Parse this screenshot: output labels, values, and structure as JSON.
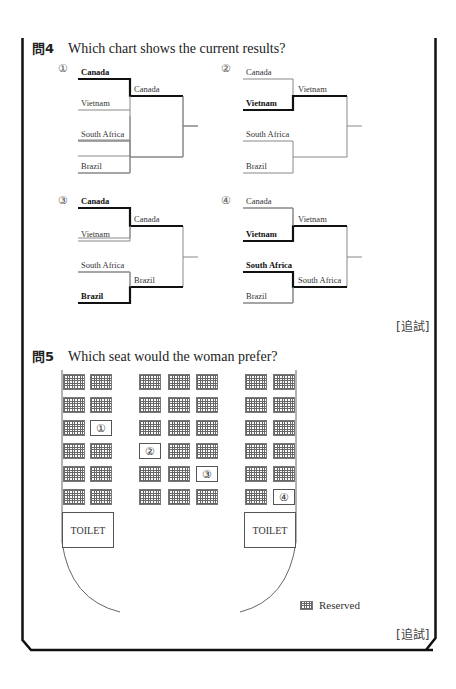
{
  "question4": {
    "number": "問4",
    "prompt": "Which chart shows the current results?",
    "options": [
      {
        "label": "①",
        "teams": [
          "Canada",
          "Vietnam",
          "South Africa",
          "Brazil"
        ],
        "winners_round1": [
          "Canada",
          ""
        ],
        "bold": [
          "Canada"
        ]
      },
      {
        "label": "②",
        "teams": [
          "Canada",
          "Vietnam",
          "South Africa",
          "Brazil"
        ],
        "winners_round1": [
          "Vietnam",
          ""
        ],
        "bold": [
          "Vietnam"
        ]
      },
      {
        "label": "③",
        "teams": [
          "Canada",
          "Vietnam",
          "South Africa",
          "Brazil"
        ],
        "winners_round1": [
          "Canada",
          "Brazil"
        ],
        "bold": [
          "Canada",
          "Brazil"
        ]
      },
      {
        "label": "④",
        "teams": [
          "Canada",
          "Vietnam",
          "South Africa",
          "Brazil"
        ],
        "winners_round1": [
          "Vietnam",
          "South Africa"
        ],
        "bold": [
          "Vietnam",
          "South Africa"
        ]
      }
    ],
    "source_tag": "[追試]"
  },
  "question5": {
    "number": "問5",
    "prompt": "Which seat would the woman prefer?",
    "seat_labels": [
      "①",
      "②",
      "③",
      "④"
    ],
    "toilet_label": "TOILET",
    "legend_label": "Reserved",
    "source_tag": "[追試]"
  }
}
